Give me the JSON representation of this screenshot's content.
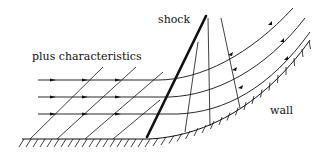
{
  "diagram": {
    "type": "flow-characteristics-sketch",
    "labels": {
      "plus_characteristics": "plus characteristics",
      "shock": "shock",
      "wall": "wall"
    },
    "elements": {
      "streamlines": 3,
      "plus_characteristics_before_shock": 4,
      "characteristics_after_shock": 3,
      "shock_count": 1,
      "wall": "flat then concave upward curve with hatching"
    },
    "colors": {
      "line": "#111111",
      "background": "#ffffff"
    }
  }
}
